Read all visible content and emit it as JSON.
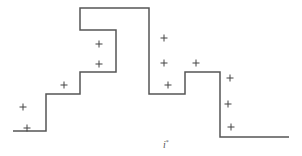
{
  "diagram": {
    "type": "step-function-with-markers",
    "line_color": "#555555",
    "marker_color": "#444444",
    "step_path": [
      [
        13,
        131
      ],
      [
        46,
        131
      ],
      [
        46,
        94
      ],
      [
        80,
        94
      ],
      [
        80,
        72
      ],
      [
        116,
        72
      ],
      [
        116,
        30
      ],
      [
        80,
        30
      ],
      [
        80,
        8
      ],
      [
        149,
        8
      ],
      [
        149,
        94
      ],
      [
        185,
        94
      ],
      [
        185,
        72
      ],
      [
        220,
        72
      ],
      [
        220,
        137
      ],
      [
        289,
        137
      ]
    ],
    "markers": [
      [
        23,
        107
      ],
      [
        27,
        128
      ],
      [
        64,
        85
      ],
      [
        99,
        44
      ],
      [
        99,
        64
      ],
      [
        164,
        38
      ],
      [
        164,
        63
      ],
      [
        196,
        63
      ],
      [
        168,
        85
      ],
      [
        230,
        78
      ],
      [
        228,
        104
      ],
      [
        231,
        127
      ]
    ],
    "xlabel": {
      "main": "i",
      "sup": "*"
    }
  }
}
